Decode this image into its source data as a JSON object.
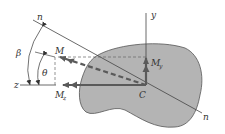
{
  "diagram": {
    "labels": {
      "n_top": "n",
      "n_bottom": "n",
      "y_axis": "y",
      "z_axis": "z",
      "beta": "β",
      "theta": "θ",
      "moment": "M",
      "my_main": "M",
      "my_sub": "y",
      "mz_main": "M",
      "mz_sub": "z",
      "centroid": "C"
    },
    "colors": {
      "section_fill": "#b4b4b4",
      "section_stroke": "#555555",
      "arrow": "#5a5a5a",
      "line": "#444444",
      "dashed": "#666666"
    }
  }
}
